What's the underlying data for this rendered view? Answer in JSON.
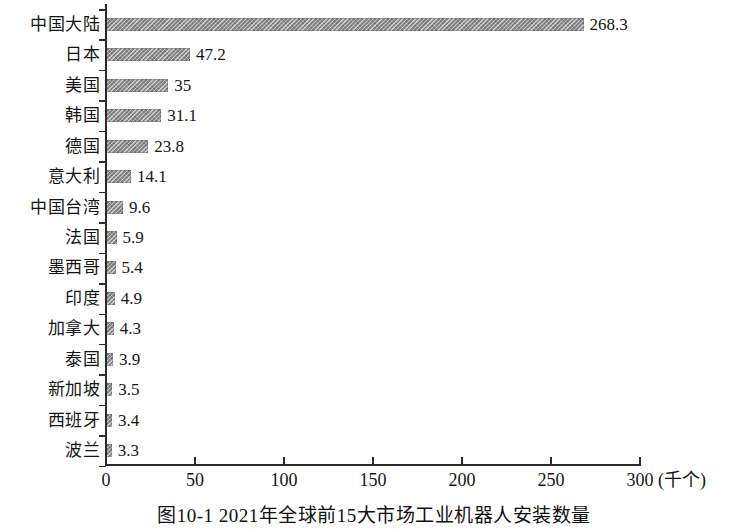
{
  "chart_data": {
    "type": "bar",
    "orientation": "horizontal",
    "title": "图10-1  2021年全球前15大市场工业机器人安装数量",
    "xlabel": "(千个)",
    "ylabel": "",
    "xlim": [
      0,
      300
    ],
    "xticks": [
      0,
      50,
      100,
      150,
      200,
      250,
      300
    ],
    "xtick_labels": [
      "0",
      "50",
      "100",
      "150",
      "200",
      "250",
      "300"
    ],
    "grid": false,
    "legend": null,
    "bar_color": "#8f8f8f",
    "categories": [
      "中国大陆",
      "日本",
      "美国",
      "韩国",
      "德国",
      "意大利",
      "中国台湾",
      "法国",
      "墨西哥",
      "印度",
      "加拿大",
      "泰国",
      "新加坡",
      "西班牙",
      "波兰"
    ],
    "values": [
      268.3,
      47.2,
      35,
      31.1,
      23.8,
      14.1,
      9.6,
      5.9,
      5.4,
      4.9,
      4.3,
      3.9,
      3.5,
      3.4,
      3.3
    ],
    "value_labels": [
      "268.3",
      "47.2",
      "35",
      "31.1",
      "23.8",
      "14.1",
      "9.6",
      "5.9",
      "5.4",
      "4.9",
      "4.3",
      "3.9",
      "3.5",
      "3.4",
      "3.3"
    ]
  },
  "caption": {
    "text": "图10-1  2021年全球前15大市场工业机器人安装数量"
  },
  "axis": {
    "x_unit": "(千个)"
  }
}
